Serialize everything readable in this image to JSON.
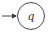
{
  "diagram": {
    "type": "automaton-state",
    "states": [
      {
        "id": "q",
        "label": "q",
        "initial": true,
        "accepting": false
      }
    ],
    "colors": {
      "stroke": "#333333",
      "background": "#ffffff"
    }
  }
}
